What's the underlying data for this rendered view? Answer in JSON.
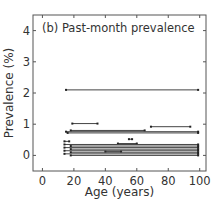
{
  "chart_data": {
    "type": "line",
    "title": "(b) Past-month prevalence",
    "xlabel": "Age (years)",
    "ylabel": "Prevalence (%)",
    "xlim": [
      -6,
      104
    ],
    "ylim": [
      -0.5,
      4.5
    ],
    "xticks": [
      0,
      20,
      40,
      60,
      80,
      100
    ],
    "yticks": [
      0,
      1,
      2,
      3,
      4
    ],
    "grid": false,
    "legend": null,
    "series": [
      {
        "name": "segment",
        "x": [
          15,
          99
        ],
        "y": [
          2.1,
          2.1
        ]
      },
      {
        "name": "segment",
        "x": [
          19,
          35
        ],
        "y": [
          1.02,
          1.02
        ]
      },
      {
        "name": "segment",
        "x": [
          69,
          94
        ],
        "y": [
          0.92,
          0.92
        ]
      },
      {
        "name": "segment",
        "x": [
          18,
          65
        ],
        "y": [
          0.8,
          0.8
        ]
      },
      {
        "name": "segment",
        "x": [
          15,
          99
        ],
        "y": [
          0.76,
          0.76
        ]
      },
      {
        "name": "segment",
        "x": [
          16,
          99
        ],
        "y": [
          0.72,
          0.72
        ]
      },
      {
        "name": "segment",
        "x": [
          55,
          57
        ],
        "y": [
          0.52,
          0.52
        ]
      },
      {
        "name": "segment",
        "x": [
          14,
          17
        ],
        "y": [
          0.45,
          0.45
        ]
      },
      {
        "name": "segment",
        "x": [
          48,
          60
        ],
        "y": [
          0.38,
          0.38
        ]
      },
      {
        "name": "segment",
        "x": [
          14,
          99
        ],
        "y": [
          0.35,
          0.35
        ]
      },
      {
        "name": "segment",
        "x": [
          18,
          99
        ],
        "y": [
          0.3,
          0.3
        ]
      },
      {
        "name": "segment",
        "x": [
          14,
          99
        ],
        "y": [
          0.25,
          0.25
        ]
      },
      {
        "name": "segment",
        "x": [
          18,
          99
        ],
        "y": [
          0.2,
          0.2
        ]
      },
      {
        "name": "segment",
        "x": [
          14,
          99
        ],
        "y": [
          0.15,
          0.15
        ]
      },
      {
        "name": "segment",
        "x": [
          40,
          50
        ],
        "y": [
          0.12,
          0.12
        ]
      },
      {
        "name": "segment",
        "x": [
          18,
          99
        ],
        "y": [
          0.1,
          0.1
        ]
      },
      {
        "name": "segment",
        "x": [
          14,
          99
        ],
        "y": [
          0.05,
          0.05
        ]
      },
      {
        "name": "segment",
        "x": [
          18,
          99
        ],
        "y": [
          0.0,
          0.0
        ]
      }
    ]
  },
  "colors": {
    "axis": "#555555",
    "line": "#444444",
    "text": "#333333"
  }
}
